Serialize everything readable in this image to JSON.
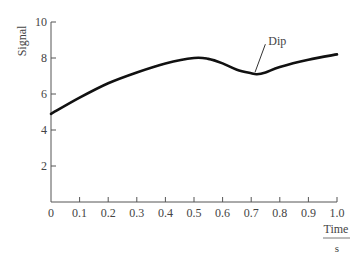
{
  "chart_data": {
    "type": "line",
    "title": "",
    "xlabel": "Time",
    "xlabel_unit": "s",
    "ylabel": "Signal",
    "xlim": [
      0,
      1.0
    ],
    "ylim": [
      0,
      10
    ],
    "x_ticks": [
      "0",
      "0.1",
      "0.2",
      "0.3",
      "0.4",
      "0.5",
      "0.6",
      "0.7",
      "0.8",
      "0.9",
      "1.0"
    ],
    "y_ticks": [
      "2",
      "4",
      "6",
      "8",
      "10"
    ],
    "grid": false,
    "legend": null,
    "series": [
      {
        "name": "Signal",
        "color": "#111111",
        "x": [
          0,
          0.1,
          0.2,
          0.3,
          0.4,
          0.5,
          0.55,
          0.6,
          0.65,
          0.7,
          0.72,
          0.75,
          0.8,
          0.9,
          1.0
        ],
        "y": [
          4.9,
          5.8,
          6.6,
          7.2,
          7.7,
          8.0,
          7.95,
          7.7,
          7.35,
          7.15,
          7.1,
          7.2,
          7.5,
          7.9,
          8.2
        ]
      }
    ],
    "annotations": [
      {
        "text": "Dip",
        "x": 0.71,
        "y": 7.1,
        "label_x": 0.76,
        "label_y": 8.6
      }
    ]
  }
}
